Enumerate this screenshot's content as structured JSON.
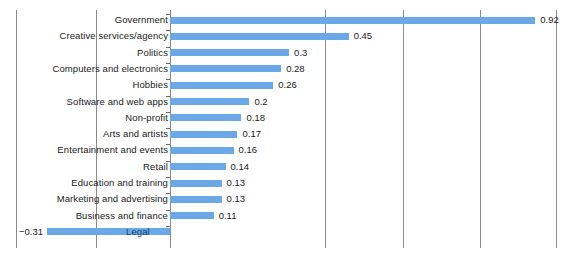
{
  "chart_data": {
    "type": "bar",
    "orientation": "horizontal",
    "title": "",
    "subtitle": "",
    "xlabel": "",
    "ylabel": "",
    "categories": [
      "Government",
      "Creative services/agency",
      "Politics",
      "Computers and electronics",
      "Hobbies",
      "Software and web apps",
      "Non-profit",
      "Arts and artists",
      "Entertainment and events",
      "Retail",
      "Education and training",
      "Marketing and advertising",
      "Business and finance",
      "Legal"
    ],
    "values": [
      0.92,
      0.45,
      0.3,
      0.28,
      0.26,
      0.2,
      0.18,
      0.17,
      0.16,
      0.14,
      0.13,
      0.13,
      0.11,
      -0.31
    ],
    "value_labels": [
      "0.92",
      "0.45",
      "0.3",
      "0.28",
      "0.26",
      "0.2",
      "0.18",
      "0.17",
      "0.16",
      "0.14",
      "0.13",
      "0.13",
      "0.11",
      "−0.31"
    ],
    "xlim": [
      -0.38,
      0.97
    ],
    "gridline_values": [
      -0.19,
      0.0,
      0.39,
      0.59,
      0.78,
      0.97
    ],
    "grid": true,
    "legend": false,
    "bar_color": "#6aa8e8",
    "gridline_color": "#8a8a8a",
    "text_color": "#1a1a1a",
    "background_color": "#ffffff"
  }
}
